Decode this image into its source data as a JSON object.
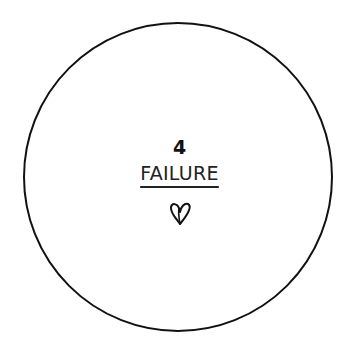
{
  "card": {
    "number": "4",
    "label": "FAILURE",
    "icon": "heart-icon"
  },
  "colors": {
    "stroke": "#111111",
    "background": "#ffffff"
  }
}
